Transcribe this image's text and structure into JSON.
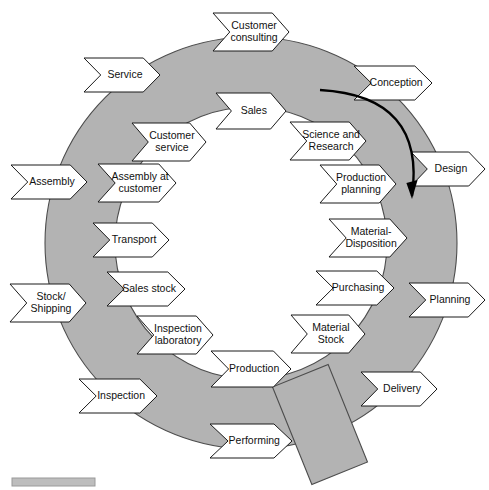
{
  "diagram": {
    "type": "cycle-ring",
    "colors": {
      "ring_fill": "#b3b3b3",
      "ring_stroke": "#4d4d4d",
      "chevron_fill": "#ffffff",
      "chevron_stroke": "#1a1a1a",
      "background": "#ffffff",
      "arrow": "#000000",
      "footer_bar": "#bdbdbd"
    },
    "ring": {
      "center_x": 251,
      "center_y": 243,
      "outer_radius": 206,
      "inner_radius": 136
    },
    "flow_arrow": {
      "name": "clockwise-flow-arrow",
      "direction": "clockwise",
      "start_x": 320,
      "start_y": 90,
      "end_x": 412,
      "end_y": 196
    },
    "overlay_rect": {
      "name": "rotated-gray-rectangle",
      "x": 290,
      "y": 372,
      "width": 60,
      "height": 105,
      "rotation_deg": -22
    },
    "footer_bar": {
      "name": "footer-gray-bar",
      "x": 12,
      "y": 478,
      "width": 83,
      "height": 8
    },
    "outer_chevrons": [
      {
        "id": "customer-consulting",
        "label_lines": [
          "Customer",
          "consulting"
        ],
        "cx": 251,
        "cy": 32,
        "angle": 0,
        "w": 76,
        "h": 38
      },
      {
        "id": "service",
        "label_lines": [
          "Service"
        ],
        "cx": 122,
        "cy": 75,
        "angle": 0,
        "w": 76,
        "h": 34
      },
      {
        "id": "conception",
        "label_lines": [
          "Conception"
        ],
        "cx": 393,
        "cy": 83,
        "angle": 0,
        "w": 78,
        "h": 34
      },
      {
        "id": "assembly",
        "label_lines": [
          "Assembly"
        ],
        "cx": 49,
        "cy": 182,
        "angle": 0,
        "w": 76,
        "h": 34
      },
      {
        "id": "design",
        "label_lines": [
          "Design"
        ],
        "cx": 448,
        "cy": 169,
        "angle": 0,
        "w": 74,
        "h": 34
      },
      {
        "id": "stock-shipping",
        "label_lines": [
          "Stock/",
          "Shipping"
        ],
        "cx": 48,
        "cy": 303,
        "angle": 0,
        "w": 76,
        "h": 38
      },
      {
        "id": "planning",
        "label_lines": [
          "Planning"
        ],
        "cx": 447,
        "cy": 300,
        "angle": 0,
        "w": 76,
        "h": 34
      },
      {
        "id": "inspection",
        "label_lines": [
          "Inspection"
        ],
        "cx": 118,
        "cy": 396,
        "angle": 0,
        "w": 78,
        "h": 34
      },
      {
        "id": "delivery",
        "label_lines": [
          "Delivery"
        ],
        "cx": 399,
        "cy": 389,
        "angle": 0,
        "w": 76,
        "h": 34
      },
      {
        "id": "performing",
        "label_lines": [
          "Performing"
        ],
        "cx": 251,
        "cy": 441,
        "angle": 0,
        "w": 82,
        "h": 34
      }
    ],
    "inner_chevrons": [
      {
        "id": "sales",
        "label_lines": [
          "Sales"
        ],
        "cx": 251,
        "cy": 111,
        "angle": 0,
        "w": 70,
        "h": 36
      },
      {
        "id": "customer-service",
        "label_lines": [
          "Customer",
          "service"
        ],
        "cx": 169,
        "cy": 142,
        "angle": 0,
        "w": 74,
        "h": 38
      },
      {
        "id": "science-and-research",
        "label_lines": [
          "Science and",
          "Research"
        ],
        "cx": 328,
        "cy": 141,
        "angle": 0,
        "w": 76,
        "h": 38
      },
      {
        "id": "assembly-at-customer",
        "label_lines": [
          "Assembly at",
          "customer"
        ],
        "cx": 137,
        "cy": 183,
        "angle": 0,
        "w": 78,
        "h": 38
      },
      {
        "id": "production-planning",
        "label_lines": [
          "Production",
          "planning"
        ],
        "cx": 358,
        "cy": 184,
        "angle": 0,
        "w": 76,
        "h": 38
      },
      {
        "id": "transport",
        "label_lines": [
          "Transport"
        ],
        "cx": 131,
        "cy": 240,
        "angle": 0,
        "w": 76,
        "h": 34
      },
      {
        "id": "material-disposition",
        "label_lines": [
          "Material-",
          "Disposition"
        ],
        "cx": 368,
        "cy": 238,
        "angle": 0,
        "w": 78,
        "h": 38
      },
      {
        "id": "sales-stock",
        "label_lines": [
          "Sales stock"
        ],
        "cx": 146,
        "cy": 289,
        "angle": 0,
        "w": 78,
        "h": 34
      },
      {
        "id": "purchasing",
        "label_lines": [
          "Purchasing"
        ],
        "cx": 355,
        "cy": 288,
        "angle": 0,
        "w": 78,
        "h": 34
      },
      {
        "id": "inspection-laboratory",
        "label_lines": [
          "Inspection",
          "laboratory"
        ],
        "cx": 175,
        "cy": 335,
        "angle": 0,
        "w": 76,
        "h": 38
      },
      {
        "id": "material-stock",
        "label_lines": [
          "Material",
          "Stock"
        ],
        "cx": 328,
        "cy": 334,
        "angle": 0,
        "w": 74,
        "h": 38
      },
      {
        "id": "production",
        "label_lines": [
          "Production"
        ],
        "cx": 251,
        "cy": 369,
        "angle": 0,
        "w": 80,
        "h": 36
      }
    ]
  }
}
